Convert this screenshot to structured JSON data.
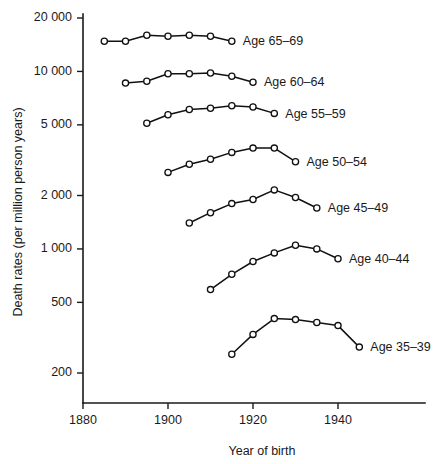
{
  "chart_data": {
    "type": "line",
    "title": "",
    "xlabel": "Year of birth",
    "ylabel": "Death rates (per million person years)",
    "xlim": [
      1875,
      1952
    ],
    "ylim": [
      170,
      22000
    ],
    "yscale": "log",
    "grid": false,
    "legend_position": "inline-right-of-line-end",
    "x_ticks": [
      1880,
      1900,
      1920,
      1940
    ],
    "x_tick_labels": [
      "1880",
      "1900",
      "1920",
      "1940"
    ],
    "y_ticks": [
      200,
      500,
      1000,
      2000,
      5000,
      10000,
      20000
    ],
    "y_tick_labels": [
      "200",
      "500",
      "1 000",
      "2 000",
      "5 000",
      "10 000",
      "20 000"
    ],
    "series": [
      {
        "name": "Age 65–69",
        "label": "Age 65–69",
        "x": [
          1885,
          1890,
          1895,
          1900,
          1905,
          1910,
          1915
        ],
        "values": [
          14800,
          14800,
          16000,
          15800,
          16000,
          15800,
          14800
        ]
      },
      {
        "name": "Age 60–64",
        "label": "Age 60–64",
        "x": [
          1890,
          1895,
          1900,
          1905,
          1910,
          1915,
          1920
        ],
        "values": [
          8600,
          8800,
          9700,
          9700,
          9800,
          9400,
          8700
        ]
      },
      {
        "name": "Age 55–59",
        "label": "Age 55–59",
        "x": [
          1895,
          1900,
          1905,
          1910,
          1915,
          1920,
          1925
        ],
        "values": [
          5100,
          5700,
          6100,
          6200,
          6400,
          6300,
          5800
        ]
      },
      {
        "name": "Age 50–54",
        "label": "Age 50–54",
        "x": [
          1900,
          1905,
          1910,
          1915,
          1920,
          1925,
          1930
        ],
        "values": [
          2700,
          3000,
          3200,
          3500,
          3700,
          3700,
          3100
        ]
      },
      {
        "name": "Age 45–49",
        "label": "Age 45–49",
        "x": [
          1905,
          1910,
          1915,
          1920,
          1925,
          1930,
          1935
        ],
        "values": [
          1400,
          1600,
          1800,
          1900,
          2150,
          1950,
          1700
        ]
      },
      {
        "name": "Age 40–44",
        "label": "Age 40–44",
        "x": [
          1910,
          1915,
          1920,
          1925,
          1930,
          1935,
          1940
        ],
        "values": [
          590,
          720,
          850,
          950,
          1050,
          1000,
          880
        ]
      },
      {
        "name": "Age 35–39",
        "label": "Age 35–39",
        "x": [
          1915,
          1920,
          1925,
          1930,
          1935,
          1940,
          1945
        ],
        "values": [
          255,
          330,
          405,
          400,
          385,
          370,
          280
        ]
      }
    ]
  },
  "colors": {
    "line": "#111111",
    "marker_fill": "#ffffff",
    "axis": "#1a1a1a",
    "background": "#ffffff"
  }
}
